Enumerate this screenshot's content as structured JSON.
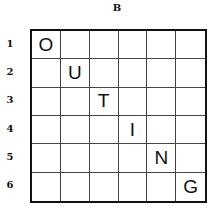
{
  "puzzle": {
    "title": "B",
    "row_labels": [
      "1",
      "2",
      "3",
      "4",
      "5",
      "6"
    ],
    "grid": [
      [
        "O",
        "",
        "",
        "",
        "",
        ""
      ],
      [
        "",
        "U",
        "",
        "",
        "",
        ""
      ],
      [
        "",
        "",
        "T",
        "",
        "",
        ""
      ],
      [
        "",
        "",
        "",
        "I",
        "",
        ""
      ],
      [
        "",
        "",
        "",
        "",
        "N",
        ""
      ],
      [
        "",
        "",
        "",
        "",
        "",
        "G"
      ]
    ]
  }
}
